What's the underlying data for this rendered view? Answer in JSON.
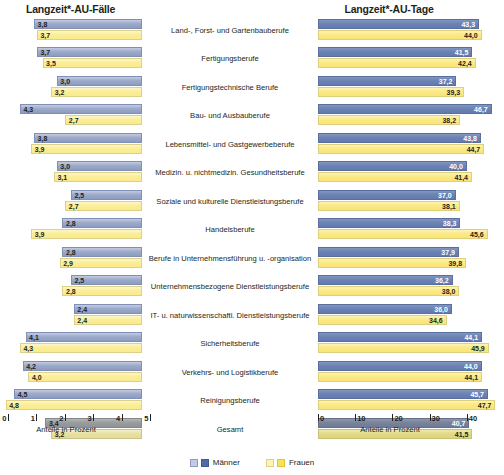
{
  "titles": {
    "left": "Langzeit*-AU-Fälle",
    "right": "Langzeit*-AU-Tage"
  },
  "axis": {
    "left": {
      "title": "Anteile in Prozent",
      "ticks": [
        "5",
        "4",
        "3",
        "2",
        "1",
        "0"
      ],
      "min": 0,
      "max": 5,
      "reversed": true
    },
    "right": {
      "title": "Anteile in Prozent",
      "ticks": [
        "0",
        "10",
        "20",
        "30",
        "40",
        "50"
      ],
      "min": 0,
      "max": 50,
      "reversed": false
    }
  },
  "legend": [
    {
      "label": "Männer",
      "color_light": "#c3cbe2",
      "color_dark": "#4f6ba8"
    },
    {
      "label": "Frauen",
      "color_light": "#fdf3b4",
      "color_dark": "#fbe34f"
    }
  ],
  "chart_data": {
    "type": "bar",
    "orientation": "horizontal",
    "layout": "butterfly/tornado (two panels sharing centered category labels)",
    "grid": false,
    "legend_position": "bottom-center",
    "categories": [
      "Land-, Forst- und Gartenbauberufe",
      "Fertigungsberufe",
      "Fertigungstechnische Berufe",
      "Bau- und Ausbauberufe",
      "Lebensmittel- und Gastgewerbeberufe",
      "Medizin. u. nichtmedizin. Gesundheitsberufe",
      "Soziale und kulturelle Dienstleistungsberufe",
      "Handelsberufe",
      "Berufe in Unternehmensführung u. -organisation",
      "Unternehmensbezogene Dienstleistungsberufe",
      "IT- u. naturwissenschaftl. Dienstleistungsberufe",
      "Sicherheitsberufe",
      "Verkehrs- und Logistikberufe",
      "Reinigungsberufe",
      "Gesamt"
    ],
    "panels": [
      {
        "name": "Langzeit*-AU-Fälle",
        "xlabel": "Anteile in Prozent",
        "xlim": [
          0,
          5
        ],
        "series": [
          {
            "name": "Männer",
            "values": [
              3.8,
              3.7,
              3.0,
              4.3,
              3.8,
              3.0,
              2.5,
              2.8,
              2.8,
              2.5,
              2.4,
              4.1,
              4.2,
              4.5,
              3.4
            ],
            "labels": [
              "3,8",
              "3,7",
              "3,0",
              "4,3",
              "3,8",
              "3,0",
              "2,5",
              "2,8",
              "2,8",
              "2,5",
              "2,4",
              "4,1",
              "4,2",
              "4,5",
              "3,4"
            ]
          },
          {
            "name": "Frauen",
            "values": [
              3.7,
              3.5,
              3.2,
              2.7,
              3.9,
              3.1,
              2.7,
              3.9,
              2.9,
              2.8,
              2.4,
              4.3,
              4.0,
              4.8,
              3.2
            ],
            "labels": [
              "3,7",
              "3,5",
              "3,2",
              "2,7",
              "3,9",
              "3,1",
              "2,7",
              "3,9",
              "2,9",
              "2,8",
              "2,4",
              "4,3",
              "4,0",
              "4,8",
              "3,2"
            ]
          }
        ]
      },
      {
        "name": "Langzeit*-AU-Tage",
        "xlabel": "Anteile in Prozent",
        "xlim": [
          0,
          50
        ],
        "series": [
          {
            "name": "Männer",
            "values": [
              43.3,
              41.5,
              37.2,
              46.7,
              43.8,
              40.0,
              37.0,
              38.3,
              37.9,
              36.2,
              36.0,
              44.1,
              44.0,
              45.7,
              40.7
            ],
            "labels": [
              "43,3",
              "41,5",
              "37,2",
              "46,7",
              "43,8",
              "40,0",
              "37,0",
              "38,3",
              "37,9",
              "36,2",
              "36,0",
              "44,1",
              "44,0",
              "45,7",
              "40,7"
            ]
          },
          {
            "name": "Frauen",
            "values": [
              44.0,
              42.4,
              39.3,
              38.2,
              44.7,
              41.4,
              38.1,
              45.6,
              39.8,
              38.0,
              34.6,
              45.9,
              44.1,
              47.7,
              41.5
            ],
            "labels": [
              "44,0",
              "42,4",
              "39,3",
              "38,2",
              "44,7",
              "41,4",
              "38,1",
              "45,6",
              "39,8",
              "38,0",
              "34,6",
              "45,9",
              "44,1",
              "47,7",
              "41,5"
            ]
          }
        ]
      }
    ]
  }
}
